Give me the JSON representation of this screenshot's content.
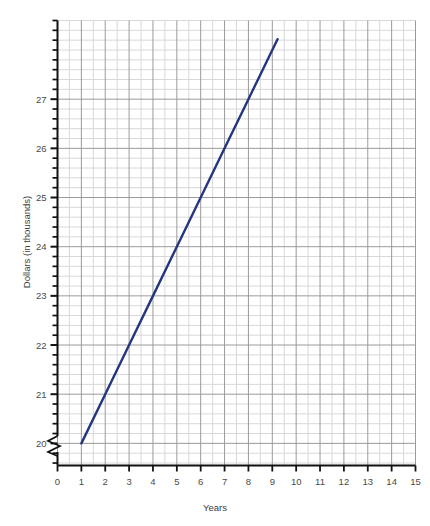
{
  "chart_data": {
    "type": "line",
    "title": "",
    "subtitle": "",
    "xlabel": "Years",
    "ylabel": "Dollars (in thousands)",
    "xlim": [
      0,
      15
    ],
    "ylim": [
      19.55,
      28.6
    ],
    "y_axis_break": true,
    "y_axis_break_symbol": "zigzag",
    "grid": true,
    "grid_major_color": "#9a9a9a",
    "grid_minor_color": "#d8d8d8",
    "legend": "none",
    "x_ticks": [
      0,
      1,
      2,
      3,
      4,
      5,
      6,
      7,
      8,
      9,
      10,
      11,
      12,
      13,
      14,
      15
    ],
    "x_tick_labels": [
      "0",
      "1",
      "2",
      "3",
      "4",
      "5",
      "6",
      "7",
      "8",
      "9",
      "10",
      "11",
      "12",
      "13",
      "14",
      "15"
    ],
    "x_minor_subdivisions": 2,
    "y_ticks": [
      20,
      21,
      22,
      23,
      24,
      25,
      26,
      27
    ],
    "y_tick_labels": [
      "20",
      "21",
      "22",
      "23",
      "24",
      "25",
      "26",
      "27"
    ],
    "y_minor_subdivisions": 5,
    "series": [
      {
        "name": "Salary",
        "color": "#23367f",
        "line_width": 2.4,
        "x": [
          1,
          2,
          3,
          4,
          5,
          6,
          7,
          8,
          9,
          9.22
        ],
        "values": [
          20,
          21,
          22,
          23,
          24,
          25,
          26,
          27,
          28,
          28.22
        ],
        "slope_per_year": 1,
        "intercept": 19,
        "endpoint_start": [
          1,
          20
        ],
        "endpoint_end": [
          9.22,
          28.22
        ]
      }
    ],
    "annotations": []
  },
  "axes": {
    "x_axis_label": "Years",
    "y_axis_label": "Dollars (in thousands)"
  }
}
